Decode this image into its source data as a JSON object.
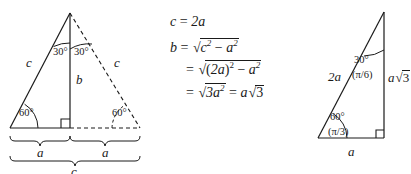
{
  "figure": {
    "background_color": "#ffffff",
    "line_color": "#1a1a1a"
  },
  "left_triangle": {
    "name": "equilateral-triangle-split",
    "labels": {
      "angle_apex_left": "30°",
      "angle_apex_right": "30°",
      "angle_base_left": "60°",
      "angle_base_right": "60°",
      "side_left": "c",
      "side_right_dashed": "c",
      "altitude": "b",
      "brace_left": "a",
      "brace_right": "a",
      "brace_bottom": "c"
    }
  },
  "equations": {
    "line1": {
      "lhs": "c",
      "eq": "=",
      "rhs": "2a"
    },
    "line2": {
      "lhs": "b",
      "eq": "=",
      "radicand_a": "c",
      "radicand_a_exp": "2",
      "minus": "−",
      "radicand_b": "a",
      "radicand_b_exp": "2"
    },
    "line3": {
      "eq": "=",
      "open": "(",
      "base": "2a",
      "close": ")",
      "exp": "2",
      "minus": "−",
      "radicand_b": "a",
      "radicand_b_exp": "2"
    },
    "line4": {
      "eq1": "=",
      "radicand": "3a",
      "radicand_exp": "2",
      "eq2": "=",
      "coef": "a",
      "root": "3"
    }
  },
  "right_triangle": {
    "name": "30-60-90-right-triangle",
    "labels": {
      "angle_top_deg": "30°",
      "angle_top_rad": "(π/6)",
      "angle_bottom_deg": "60°",
      "angle_bottom_rad": "(π/3)",
      "hypotenuse": "2a",
      "vertical_side": "a√3",
      "vertical_side_coef": "a",
      "vertical_side_root": "3",
      "base": "a"
    }
  }
}
